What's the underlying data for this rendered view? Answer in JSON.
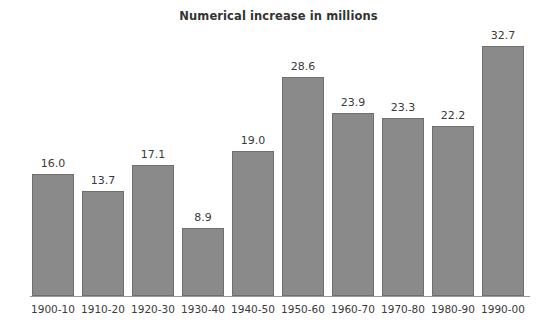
{
  "chart_data": {
    "type": "bar",
    "title": "Numerical increase in millions",
    "xlabel": "",
    "ylabel": "",
    "categories": [
      "1900-10",
      "1910-20",
      "1920-30",
      "1930-40",
      "1940-50",
      "1950-60",
      "1960-70",
      "1970-80",
      "1980-90",
      "1990-00"
    ],
    "values": [
      16.0,
      13.7,
      17.1,
      8.9,
      19.0,
      28.6,
      23.9,
      23.3,
      22.2,
      32.7
    ],
    "value_labels": [
      "16.0",
      "13.7",
      "17.1",
      "8.9",
      "19.0",
      "28.6",
      "23.9",
      "23.3",
      "22.2",
      "32.7"
    ],
    "ylim": [
      0,
      34
    ],
    "grid": false,
    "legend": null,
    "axis": {
      "x_axis_visible": true,
      "y_axis_visible": false,
      "y_ticks_visible": false
    },
    "colors": {
      "bar_fill": "#8a8a8a",
      "bar_stroke": "#6f6f6f",
      "background": "#ffffff",
      "text": "#3a3a3a",
      "title": "#333333",
      "axis_line": "#999999"
    }
  }
}
